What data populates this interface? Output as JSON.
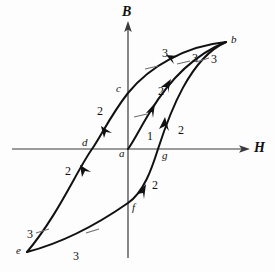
{
  "figure": {
    "type": "diagram",
    "background_color": "#fdfdfd",
    "curve_color": "#111111",
    "axis_color": "#3a3a3a"
  },
  "axes": {
    "vertical": {
      "label": "B",
      "name": "magnetic-flux-density",
      "x": 128,
      "y_top": 22,
      "y_bottom": 258,
      "label_x": 122,
      "label_y": 6
    },
    "horizontal": {
      "label": "H",
      "name": "magnetic-field-strength",
      "y": 149,
      "x_left": 12,
      "x_right": 250,
      "label_x": 254,
      "label_y": 142
    }
  },
  "points": [
    {
      "label": "a",
      "name": "origin-point-a",
      "x": 128,
      "y": 149,
      "label_x": 119,
      "label_y": 148
    },
    {
      "label": "b",
      "name": "saturation-point-b",
      "x": 226,
      "y": 42,
      "label_x": 231,
      "label_y": 34
    },
    {
      "label": "c",
      "name": "remanence-point-c",
      "x": 128,
      "y": 93,
      "label_x": 116,
      "label_y": 83
    },
    {
      "label": "d",
      "name": "coercivity-point-d",
      "x": 92,
      "y": 149,
      "label_x": 82,
      "label_y": 136
    },
    {
      "label": "e",
      "name": "reverse-saturation-point-e",
      "x": 27,
      "y": 252,
      "label_x": 17,
      "label_y": 244
    },
    {
      "label": "f",
      "name": "reverse-remanence-point-f",
      "x": 128,
      "y": 203,
      "label_x": 132,
      "label_y": 202
    },
    {
      "label": "g",
      "name": "reverse-coercivity-point-g",
      "x": 158,
      "y": 149,
      "label_x": 162,
      "label_y": 150
    }
  ],
  "segment_labels": [
    {
      "text": "1",
      "name": "segment-label-1-initial",
      "x": 147,
      "y": 130
    },
    {
      "text": "2",
      "name": "segment-label-2-upper-left",
      "x": 97,
      "y": 105
    },
    {
      "text": "2",
      "name": "segment-label-2-lower-left",
      "x": 65,
      "y": 165
    },
    {
      "text": "2",
      "name": "segment-label-2-inner-upper",
      "x": 158,
      "y": 85
    },
    {
      "text": "2",
      "name": "segment-label-2-outer-right",
      "x": 178,
      "y": 124
    },
    {
      "text": "2",
      "name": "segment-label-2-lower-center",
      "x": 152,
      "y": 179
    },
    {
      "text": "3",
      "name": "segment-label-3-upper-left",
      "x": 162,
      "y": 47
    },
    {
      "text": "3",
      "name": "segment-label-3-upper-middle",
      "x": 192,
      "y": 52
    },
    {
      "text": "3",
      "name": "segment-label-3-upper-right",
      "x": 211,
      "y": 53
    },
    {
      "text": "3",
      "name": "segment-label-3-bottom-left",
      "x": 27,
      "y": 228
    },
    {
      "text": "3",
      "name": "segment-label-3-bottom-center",
      "x": 73,
      "y": 250
    }
  ],
  "curves": [
    {
      "name": "initial-magnetization-curve",
      "from": "a",
      "to": "b",
      "path": "M 128 149 C 134 141 140 128 150 112 C 162 92 186 58 226 42"
    },
    {
      "name": "descending-branch-b-to-e",
      "from": "b",
      "to": "e",
      "path": "M 226 42 C 186 46 150 66 128 93 C 110 116 100 138 92 149 C 76 172 58 215 27 252"
    },
    {
      "name": "ascending-branch-e-to-b",
      "from": "e",
      "to": "b",
      "path": "M 27 252 C 58 244 92 228 128 203 C 144 192 152 168 158 149 C 170 112 190 58 226 42"
    }
  ]
}
